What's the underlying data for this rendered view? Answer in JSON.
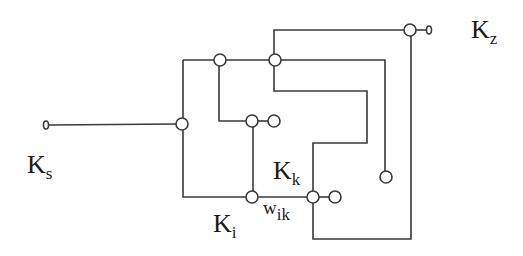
{
  "diagram": {
    "type": "network-switch-diagram",
    "stroke_color": "#3a3a3a",
    "labels": {
      "source": {
        "main": "K",
        "sub": "s"
      },
      "target": {
        "main": "K",
        "sub": "z"
      },
      "node_i": {
        "main": "K",
        "sub": "i"
      },
      "node_k": {
        "main": "K",
        "sub": "k"
      },
      "edge_weight": {
        "main": "w",
        "sub": "ik"
      }
    },
    "nodes": [
      {
        "id": "Ks-terminal",
        "x": 46,
        "y": 125
      },
      {
        "id": "junction-left",
        "x": 182,
        "y": 124
      },
      {
        "id": "junction-top-1",
        "x": 220,
        "y": 60
      },
      {
        "id": "junction-top-2",
        "x": 275,
        "y": 60
      },
      {
        "id": "junction-mid",
        "x": 252,
        "y": 121
      },
      {
        "id": "open-mid",
        "x": 273,
        "y": 121
      },
      {
        "id": "Ki",
        "x": 252,
        "y": 197
      },
      {
        "id": "Kk",
        "x": 313,
        "y": 197
      },
      {
        "id": "open-bottom",
        "x": 335,
        "y": 197
      },
      {
        "id": "open-right",
        "x": 386,
        "y": 177
      },
      {
        "id": "junction-Kz",
        "x": 410,
        "y": 30
      },
      {
        "id": "Kz-terminal",
        "x": 429,
        "y": 30
      }
    ]
  }
}
